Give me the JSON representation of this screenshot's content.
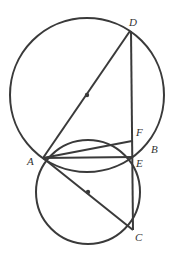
{
  "figure": {
    "type": "geometry",
    "colors": {
      "stroke": "#3a3a3a",
      "label": "#333333",
      "background": "#ffffff"
    }
  },
  "labels": {
    "A": "A",
    "B": "B",
    "C": "C",
    "D": "D",
    "E": "E",
    "F": "F"
  }
}
